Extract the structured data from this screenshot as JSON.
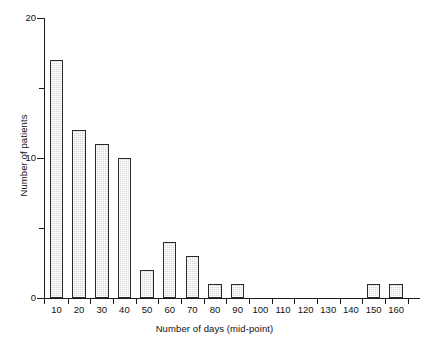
{
  "chart_data": {
    "type": "bar",
    "title": "",
    "subtitle": "",
    "xlabel": "Number of days (mid-point)",
    "ylabel": "Number of patients",
    "categories": [
      "10",
      "20",
      "30",
      "40",
      "50",
      "60",
      "70",
      "80",
      "90",
      "100",
      "110",
      "120",
      "130",
      "140",
      "150",
      "160"
    ],
    "values": [
      17,
      12,
      11,
      10,
      2,
      4,
      3,
      1,
      1,
      0,
      0,
      0,
      0,
      0,
      1,
      1
    ],
    "ylim": [
      0,
      20
    ],
    "y_major_ticks": [
      0,
      10,
      20
    ],
    "y_major_tick_labels": [
      "0",
      "10",
      "20"
    ],
    "y_minor_ticks": [
      5,
      15
    ],
    "grid": false,
    "legend": false,
    "legend_position": "none",
    "bar_fill_color": "#d6d6d6",
    "bar_edge_color": "#2b2b2b",
    "background_color": "#ffffff",
    "axis_color": "#1a1a1a",
    "annotations": []
  }
}
